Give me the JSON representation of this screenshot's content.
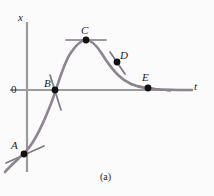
{
  "figure": {
    "caption": "(a)",
    "axes": {
      "y_label": "x",
      "x_label": "t",
      "origin_label": "0",
      "y_axis": {
        "x": 27,
        "y_top": 22,
        "y_bottom": 172
      },
      "x_axis": {
        "y": 90,
        "x_left": 10,
        "x_right": 192
      },
      "axis_color": "#9b9b9b",
      "axis_width": 2.2
    },
    "curve": {
      "color": "#8d8490",
      "width": 2.6,
      "path": "M 5 172 C 13 163, 20 158, 27 150 C 36 140, 44 122, 52 101 C 58 85, 63 65, 70 54 C 76 45, 81 40, 86 40 C 92 40, 97 46, 102 54 C 107 62, 112 69, 118 75 C 126 83, 136 87, 148 88.5 C 162 90, 178 90, 192 90"
    },
    "tangents": {
      "color": "#7e7880",
      "width": 1.7,
      "segments": [
        {
          "name": "tangent-at-A",
          "x1": 6,
          "y1": 163,
          "x2": 44,
          "y2": 146
        },
        {
          "name": "tangent-at-B",
          "x1": 50,
          "y1": 75,
          "x2": 61,
          "y2": 110
        },
        {
          "name": "tangent-at-C",
          "x1": 66,
          "y1": 40,
          "x2": 106,
          "y2": 40
        },
        {
          "name": "tangent-at-D",
          "x1": 110,
          "y1": 52,
          "x2": 125,
          "y2": 74
        },
        {
          "name": "tangent-at-E",
          "x1": 132,
          "y1": 85,
          "x2": 170,
          "y2": 91
        }
      ]
    },
    "points": [
      {
        "label": "A",
        "cx": 24,
        "cy": 154,
        "r": 3.4
      },
      {
        "label": "B",
        "cx": 55,
        "cy": 90,
        "r": 3.4
      },
      {
        "label": "C",
        "cx": 86,
        "cy": 40,
        "r": 3.4
      },
      {
        "label": "D",
        "cx": 117,
        "cy": 62,
        "r": 3.4
      },
      {
        "label": "E",
        "cx": 148,
        "cy": 88,
        "r": 3.4
      }
    ],
    "point_color": "#111111",
    "text_color": "#1c1c1c",
    "background": "#fbfbfb"
  },
  "chart_data": {
    "type": "line",
    "title": "",
    "subtitle": "",
    "caption": "(a)",
    "xlabel": "t",
    "ylabel": "x",
    "grid": false,
    "legend": null,
    "axis_origin_label": "0",
    "series": [
      {
        "name": "x(t)",
        "points": [
          {
            "t": -0.8,
            "x": -2.6
          },
          {
            "t": 0.0,
            "x": -2.0
          },
          {
            "t": 0.6,
            "x": -1.2
          },
          {
            "t": 1.2,
            "x": 0.0
          },
          {
            "t": 1.8,
            "x": 1.2
          },
          {
            "t": 2.4,
            "x": 2.1
          },
          {
            "t": 3.0,
            "x": 2.6
          },
          {
            "t": 3.6,
            "x": 2.45
          },
          {
            "t": 4.2,
            "x": 1.9
          },
          {
            "t": 4.8,
            "x": 1.0
          },
          {
            "t": 5.4,
            "x": 0.35
          },
          {
            "t": 6.0,
            "x": 0.1
          },
          {
            "t": 6.6,
            "x": 0.02
          },
          {
            "t": 7.2,
            "x": 0.0
          }
        ]
      }
    ],
    "annotated_points": [
      {
        "label": "A",
        "t": 0.0,
        "x": -2.0,
        "tangent_slope": "positive-small",
        "description": "rising, small positive slope"
      },
      {
        "label": "B",
        "t": 1.2,
        "x": 0.0,
        "tangent_slope": "positive-large",
        "description": "crosses zero, steep positive slope"
      },
      {
        "label": "C",
        "t": 3.0,
        "x": 2.6,
        "tangent_slope": "zero",
        "description": "maximum, horizontal tangent"
      },
      {
        "label": "D",
        "t": 4.2,
        "x": 1.9,
        "tangent_slope": "negative-large",
        "description": "falling, steep negative slope"
      },
      {
        "label": "E",
        "t": 5.8,
        "x": 0.15,
        "tangent_slope": "negative-small",
        "description": "nearly flat, small negative slope"
      }
    ]
  }
}
